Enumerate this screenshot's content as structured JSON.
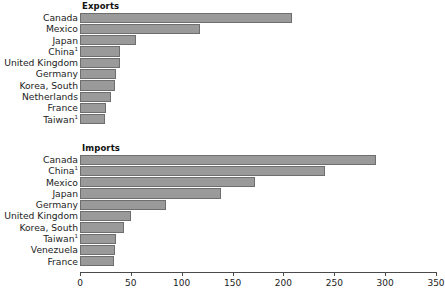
{
  "chart_data": {
    "type": "bar",
    "title": "",
    "xlabel": "",
    "ylabel": "",
    "xlim": [
      0,
      350
    ],
    "grid": false,
    "legend": null,
    "orientation": "horizontal",
    "axis": {
      "ticks": [
        0,
        50,
        100,
        150,
        200,
        250,
        300,
        350
      ],
      "tick_labels": [
        "0",
        "50",
        "100",
        "150",
        "200",
        "250",
        "300",
        "350"
      ],
      "min": 0,
      "max": 350
    },
    "bar_color": "#9a9a9a",
    "bar_border_color": "#6e6e6e",
    "panels": [
      {
        "title": "Exports",
        "categories": [
          "Canada",
          "Mexico",
          "Japan",
          "China",
          "United Kingdom",
          "Germany",
          "Korea, South",
          "Netherlands",
          "France",
          "Taiwan"
        ],
        "footnotes": [
          "",
          "",
          "",
          "1",
          "",
          "",
          "",
          "",
          "",
          "1"
        ],
        "values": [
          208,
          118,
          55,
          39,
          39,
          35,
          34,
          30,
          26,
          25
        ]
      },
      {
        "title": "Imports",
        "categories": [
          "Canada",
          "China",
          "Mexico",
          "Japan",
          "Germany",
          "United Kingdom",
          "Korea, South",
          "Taiwan",
          "Venezuela",
          "France"
        ],
        "footnotes": [
          "",
          "1",
          "",
          "",
          "",
          "",
          "",
          "1",
          "",
          ""
        ],
        "values": [
          291,
          241,
          172,
          139,
          85,
          50,
          43,
          35,
          34,
          33
        ]
      }
    ]
  }
}
